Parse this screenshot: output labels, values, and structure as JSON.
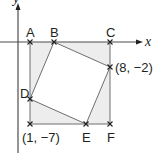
{
  "diagram": {
    "type": "coordinate-geometry",
    "axes": {
      "x_label": "x",
      "y_label": "y"
    },
    "points": [
      {
        "id": "A",
        "label": "A"
      },
      {
        "id": "B",
        "label": "B"
      },
      {
        "id": "C",
        "label": "C"
      },
      {
        "id": "D",
        "label": "D"
      },
      {
        "id": "E",
        "label": "E"
      },
      {
        "id": "F",
        "label": "F"
      },
      {
        "id": "P82",
        "label": "(8, −2)"
      },
      {
        "id": "P17",
        "label": "(1, −7)"
      }
    ],
    "shapes": {
      "outer_square": "A-C-F-(1,−7)",
      "inner_quadrilateral": "B-(8,−2)-E-D"
    },
    "colors": {
      "shade": "#ededed",
      "line": "#231f20",
      "axis": "#4d4d4f"
    }
  }
}
